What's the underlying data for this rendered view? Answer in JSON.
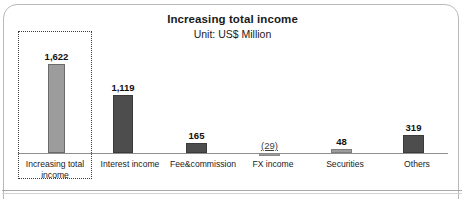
{
  "chart_data": {
    "type": "bar",
    "title": "Increasing total income",
    "subtitle": "Unit: US$ Million",
    "xlabel": "",
    "ylabel": "",
    "unit": "US$ Million",
    "categories": [
      "Increasing total income",
      "Interest income",
      "Fee&commission",
      "FX income",
      "Securities",
      "Others"
    ],
    "values": [
      1622,
      1119,
      165,
      -29,
      48,
      319
    ],
    "value_labels": [
      "1,622",
      "1,119",
      "165",
      "(29)",
      "48",
      "319"
    ],
    "ylim": [
      -100,
      1750
    ],
    "grid": false,
    "legend": null,
    "series": [
      {
        "name": "Income",
        "values": [
          1622,
          1119,
          165,
          -29,
          48,
          319
        ]
      }
    ],
    "annotations": [
      {
        "type": "highlight-box",
        "style": "dotted",
        "target_category": "Increasing total income"
      }
    ],
    "colors": {
      "total_bar": "#9c9c9c",
      "component_bar": "#4d4d4d",
      "bar_outline": "#5f5f5f",
      "axis": "#8e8e8e",
      "text": "#1a1a1a",
      "frame": "#b9b9b9",
      "highlight_border": "#3a3a3a"
    }
  },
  "bars": [
    {
      "label": "Increasing total income",
      "value_label": "1,622",
      "left": 48,
      "width": 17,
      "height": 89,
      "fill": "#9c9c9c",
      "outline": "#6a6a6a",
      "negative": false,
      "label_left": 19,
      "label_width": 72
    },
    {
      "label": "Interest income",
      "value_label": "1,119",
      "left": 113,
      "width": 20,
      "height": 58,
      "fill": "#4d4d4d",
      "outline": "#3b3b3b",
      "negative": false,
      "label_left": 94,
      "label_width": 72
    },
    {
      "label": "Fee&commission",
      "value_label": "165",
      "left": 186,
      "width": 21,
      "height": 10,
      "fill": "#4d4d4d",
      "outline": "#3b3b3b",
      "negative": false,
      "label_left": 163,
      "label_width": 80
    },
    {
      "label": "FX income",
      "value_label": "(29)",
      "left": 259,
      "width": 21,
      "height": 3,
      "fill": "#9c9c9c",
      "outline": "#8a8a8a",
      "negative": true,
      "label_left": 238,
      "label_width": 70
    },
    {
      "label": "Securities",
      "value_label": "48",
      "left": 331,
      "width": 21,
      "height": 4,
      "fill": "#9c9c9c",
      "outline": "#7d7d7d",
      "negative": false,
      "label_left": 310,
      "label_width": 70
    },
    {
      "label": "Others",
      "value_label": "319",
      "left": 403,
      "width": 21,
      "height": 18,
      "fill": "#4d4d4d",
      "outline": "#3b3b3b",
      "negative": false,
      "label_left": 382,
      "label_width": 70
    }
  ]
}
